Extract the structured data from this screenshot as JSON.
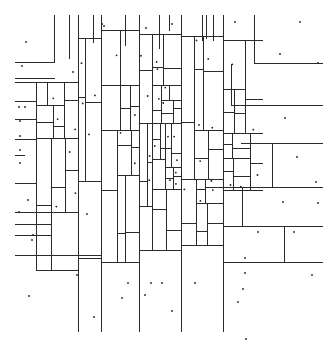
{
  "diagram": {
    "type": "kd-tree-partition",
    "width": 334,
    "height": 342,
    "colors": {
      "background": "#ffffff",
      "line": "#2a2a2a",
      "point": "#222222"
    },
    "major_verticals": [
      {
        "x": 54,
        "y1": 14,
        "y2": 62
      },
      {
        "x": 69,
        "y1": 14,
        "y2": 58
      },
      {
        "x": 78,
        "y1": 14,
        "y2": 331
      },
      {
        "x": 93,
        "y1": 14,
        "y2": 42
      },
      {
        "x": 101,
        "y1": 14,
        "y2": 331
      },
      {
        "x": 125,
        "y1": 14,
        "y2": 45
      },
      {
        "x": 139,
        "y1": 14,
        "y2": 331
      },
      {
        "x": 159,
        "y1": 14,
        "y2": 48
      },
      {
        "x": 169,
        "y1": 14,
        "y2": 30
      },
      {
        "x": 181,
        "y1": 14,
        "y2": 331
      },
      {
        "x": 202,
        "y1": 14,
        "y2": 40
      },
      {
        "x": 206,
        "y1": 14,
        "y2": 38
      },
      {
        "x": 213,
        "y1": 14,
        "y2": 40
      },
      {
        "x": 223,
        "y1": 14,
        "y2": 331
      },
      {
        "x": 254,
        "y1": 14,
        "y2": 63
      },
      {
        "x": 242,
        "y1": 187,
        "y2": 226
      },
      {
        "x": 284,
        "y1": 226,
        "y2": 262
      },
      {
        "x": 272,
        "y1": 143,
        "y2": 187
      },
      {
        "x": 231,
        "y1": 63,
        "y2": 105
      }
    ],
    "major_horizontals": [
      {
        "y": 62,
        "x1": 14,
        "x2": 54
      },
      {
        "y": 78,
        "x1": 14,
        "x2": 54
      },
      {
        "y": 82,
        "x1": 14,
        "x2": 54
      },
      {
        "y": 101,
        "x1": 14,
        "x2": 36
      },
      {
        "y": 119,
        "x1": 14,
        "x2": 36
      },
      {
        "y": 139,
        "x1": 14,
        "x2": 36
      },
      {
        "y": 155,
        "x1": 14,
        "x2": 24
      },
      {
        "y": 183,
        "x1": 14,
        "x2": 36
      },
      {
        "y": 212,
        "x1": 14,
        "x2": 51
      },
      {
        "y": 224,
        "x1": 14,
        "x2": 51
      },
      {
        "y": 235,
        "x1": 14,
        "x2": 51
      },
      {
        "y": 255,
        "x1": 14,
        "x2": 100
      },
      {
        "y": 63,
        "x1": 254,
        "x2": 322
      },
      {
        "y": 105,
        "x1": 231,
        "x2": 322
      },
      {
        "y": 143,
        "x1": 240,
        "x2": 322
      },
      {
        "y": 187,
        "x1": 223,
        "x2": 322
      },
      {
        "y": 226,
        "x1": 223,
        "x2": 322
      },
      {
        "y": 262,
        "x1": 223,
        "x2": 322
      }
    ],
    "dense_region": {
      "x1": 36,
      "y1": 30,
      "x2": 262,
      "y2": 270,
      "depth": 11,
      "seed": 7
    },
    "points": [
      [
        26,
        42
      ],
      [
        102,
        24
      ],
      [
        104,
        26
      ],
      [
        146,
        28
      ],
      [
        172,
        24
      ],
      [
        235,
        22
      ],
      [
        300,
        22
      ],
      [
        280,
        54
      ],
      [
        22,
        66
      ],
      [
        73,
        72
      ],
      [
        19,
        107
      ],
      [
        25,
        107
      ],
      [
        20,
        121
      ],
      [
        20,
        136
      ],
      [
        20,
        150
      ],
      [
        20,
        163
      ],
      [
        28,
        200
      ],
      [
        32,
        240
      ],
      [
        19,
        212
      ],
      [
        33,
        235
      ],
      [
        29,
        296
      ],
      [
        77,
        275
      ],
      [
        94,
        317
      ],
      [
        122,
        298
      ],
      [
        128,
        283
      ],
      [
        151,
        283
      ],
      [
        162,
        283
      ],
      [
        195,
        283
      ],
      [
        243,
        289
      ],
      [
        238,
        302
      ],
      [
        245,
        273
      ],
      [
        285,
        118
      ],
      [
        297,
        157
      ],
      [
        316,
        182
      ],
      [
        294,
        232
      ],
      [
        283,
        202
      ],
      [
        318,
        203
      ],
      [
        312,
        275
      ],
      [
        258,
        232
      ],
      [
        245,
        258
      ],
      [
        246,
        339
      ],
      [
        145,
        295
      ],
      [
        172,
        311
      ],
      [
        318,
        63
      ]
    ]
  }
}
